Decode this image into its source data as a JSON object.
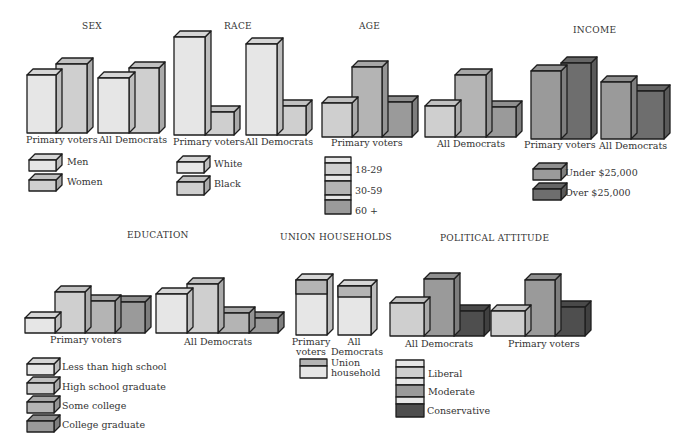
{
  "colors": {
    "c1": "#e6e6e6",
    "c2": "#cfcfcf",
    "c3": "#b4b4b4",
    "c4": "#9a9a9a",
    "c5": "#6e6e6e",
    "c6": "#4e4e4e",
    "outline": "#1e1e1e"
  },
  "panels": {
    "sex": {
      "title": "SEX",
      "groups": [
        "Primary voters",
        "All Democrats"
      ],
      "legend": [
        "Men",
        "Women"
      ]
    },
    "race": {
      "title": "RACE",
      "groups": [
        "Primary voters",
        "All Democrats"
      ],
      "legend": [
        "White",
        "Black"
      ]
    },
    "age": {
      "title": "AGE",
      "groups": [
        "Primary voters",
        "All Democrats"
      ],
      "legend": [
        "18-29",
        "30-59",
        "60 +"
      ]
    },
    "income": {
      "title": "INCOME",
      "groups": [
        "Primary voters",
        "All Democrats"
      ],
      "legend": [
        "Under $25,000",
        "Over $25,000"
      ]
    },
    "education": {
      "title": "EDUCATION",
      "groups": [
        "Primary voters",
        "All Democrats"
      ],
      "legend": [
        "Less than high school",
        "High school graduate",
        "Some college",
        "College graduate"
      ]
    },
    "union": {
      "title": "UNION HOUSEHOLDS",
      "groups_line1": [
        "Primary",
        "All"
      ],
      "groups_line2": [
        "voters",
        "Democrats"
      ],
      "legend_line1": "Union",
      "legend_line2": "household"
    },
    "attitude": {
      "title": "POLITICAL ATTITUDE",
      "groups": [
        "All Democrats",
        "Primary voters"
      ],
      "legend": [
        "Liberal",
        "Moderate",
        "Conservative"
      ]
    }
  },
  "chart_data": [
    {
      "type": "bar",
      "title": "SEX",
      "categories": [
        "Primary voters",
        "All Democrats"
      ],
      "series": [
        {
          "name": "Men",
          "values": [
            46,
            46
          ]
        },
        {
          "name": "Women",
          "values": [
            54,
            54
          ]
        }
      ],
      "xlabel": "",
      "ylabel": "relative share (estimated from bar heights)",
      "grid": false,
      "legend_position": "below"
    },
    {
      "type": "bar",
      "title": "RACE",
      "categories": [
        "Primary voters",
        "All Democrats"
      ],
      "series": [
        {
          "name": "White",
          "values": [
            81,
            76
          ]
        },
        {
          "name": "Black",
          "values": [
            19,
            24
          ]
        }
      ],
      "xlabel": "",
      "ylabel": "relative share (estimated)",
      "grid": false,
      "legend_position": "below"
    },
    {
      "type": "bar",
      "title": "AGE",
      "categories": [
        "Primary voters",
        "All Democrats"
      ],
      "series": [
        {
          "name": "18-29",
          "values": [
            25,
            25
          ]
        },
        {
          "name": "30-59",
          "values": [
            50,
            50
          ]
        },
        {
          "name": "60 +",
          "values": [
            25,
            25
          ]
        }
      ],
      "xlabel": "",
      "ylabel": "relative share (estimated)",
      "grid": false,
      "legend_position": "below"
    },
    {
      "type": "bar",
      "title": "INCOME",
      "categories": [
        "Primary voters",
        "All Democrats"
      ],
      "series": [
        {
          "name": "Under $25,000",
          "values": [
            47,
            54
          ]
        },
        {
          "name": "Over $25,000",
          "values": [
            53,
            46
          ]
        }
      ],
      "xlabel": "",
      "ylabel": "relative share (estimated)",
      "grid": false,
      "legend_position": "below"
    },
    {
      "type": "bar",
      "title": "EDUCATION",
      "categories": [
        "Primary voters",
        "All Democrats"
      ],
      "series": [
        {
          "name": "Less than high school",
          "values": [
            12,
            30
          ]
        },
        {
          "name": "High school graduate",
          "values": [
            33,
            37
          ]
        },
        {
          "name": "Some college",
          "values": [
            28,
            19
          ]
        },
        {
          "name": "College graduate",
          "values": [
            27,
            14
          ]
        }
      ],
      "xlabel": "",
      "ylabel": "relative share (estimated)",
      "grid": false,
      "legend_position": "below"
    },
    {
      "type": "bar",
      "title": "UNION HOUSEHOLDS",
      "categories": [
        "Primary voters",
        "All Democrats"
      ],
      "series": [
        {
          "name": "Union household",
          "values": [
            26,
            22
          ]
        },
        {
          "name": "Non-union",
          "values": [
            74,
            78
          ]
        }
      ],
      "xlabel": "",
      "ylabel": "relative share (estimated)",
      "grid": false,
      "legend_position": "below"
    },
    {
      "type": "bar",
      "title": "POLITICAL ATTITUDE",
      "categories": [
        "All Democrats",
        "Primary voters"
      ],
      "series": [
        {
          "name": "Liberal",
          "values": [
            29,
            23
          ]
        },
        {
          "name": "Moderate",
          "values": [
            46,
            50
          ]
        },
        {
          "name": "Conservative",
          "values": [
            25,
            27
          ]
        }
      ],
      "xlabel": "",
      "ylabel": "relative share (estimated)",
      "grid": false,
      "legend_position": "below"
    }
  ],
  "geometry": {
    "sex": {
      "base": 133,
      "groups": [
        {
          "x": 27,
          "w": [
            29,
            31
          ],
          "h": [
            58,
            69
          ],
          "c": [
            "c1",
            "c2"
          ]
        },
        {
          "x": 98,
          "w": [
            31,
            30
          ],
          "h": [
            55,
            65
          ],
          "c": [
            "c1",
            "c2"
          ]
        }
      ]
    },
    "race": {
      "base": 135,
      "groups": [
        {
          "x": 174,
          "w": [
            31,
            29
          ],
          "h": [
            98,
            23
          ],
          "c": [
            "c1",
            "c2"
          ]
        },
        {
          "x": 246,
          "w": [
            31,
            29
          ],
          "h": [
            91,
            29
          ],
          "c": [
            "c1",
            "c2"
          ]
        }
      ]
    },
    "age": {
      "base": 137,
      "groups": [
        {
          "x": 322,
          "w": [
            30,
            30,
            30
          ],
          "h": [
            34,
            70,
            35
          ],
          "c": [
            "c2",
            "c3",
            "c4"
          ]
        },
        {
          "x": 425,
          "w": [
            30,
            31,
            30
          ],
          "h": [
            31,
            62,
            30
          ],
          "c": [
            "c2",
            "c3",
            "c4"
          ]
        }
      ]
    },
    "income": {
      "base": 139,
      "groups": [
        {
          "x": 531,
          "w": [
            30,
            30
          ],
          "h": [
            68,
            76
          ],
          "c": [
            "c4",
            "c5"
          ]
        },
        {
          "x": 601,
          "w": [
            30,
            33
          ],
          "h": [
            57,
            48
          ],
          "c": [
            "c4",
            "c5"
          ]
        }
      ]
    },
    "education": {
      "base": 333,
      "groups": [
        {
          "x": 25,
          "w": [
            30,
            30,
            30,
            30
          ],
          "h": [
            15,
            41,
            32,
            31
          ],
          "c": [
            "c1",
            "c2",
            "c3",
            "c4"
          ]
        },
        {
          "x": 156,
          "w": [
            31,
            31,
            31,
            29
          ],
          "h": [
            39,
            49,
            20,
            15
          ],
          "c": [
            "c1",
            "c2",
            "c3",
            "c4"
          ]
        }
      ]
    },
    "union": {
      "base": 335,
      "groups": [
        {
          "x": 296,
          "w": [
            31
          ],
          "h": [
            55
          ],
          "c": [
            "c1"
          ],
          "cap": 14
        },
        {
          "x": 338,
          "w": [
            33
          ],
          "h": [
            49
          ],
          "c": [
            "c1"
          ],
          "cap": 11
        }
      ]
    },
    "attitude": {
      "base": 336,
      "groups": [
        {
          "x": 390,
          "w": [
            34,
            30,
            30
          ],
          "h": [
            33,
            57,
            25
          ],
          "c": [
            "c2",
            "c4",
            "c6"
          ]
        },
        {
          "x": 491,
          "w": [
            34,
            30,
            30
          ],
          "h": [
            25,
            56,
            29
          ],
          "c": [
            "c2",
            "c4",
            "c6"
          ]
        }
      ]
    }
  }
}
